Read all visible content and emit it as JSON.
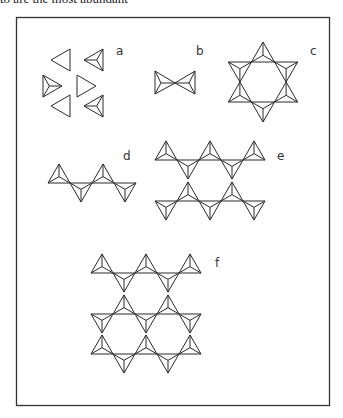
{
  "caption_fragment": "to are the most abundant",
  "figure": {
    "line_color": "#2a2a2a",
    "panels": [
      {
        "id": "a",
        "label": "a",
        "arrangement": "isolated tetrahedra (six triangles, three showing apex lines)"
      },
      {
        "id": "b",
        "label": "b",
        "arrangement": "two tetrahedra sharing one corner (bowtie)"
      },
      {
        "id": "c",
        "label": "c",
        "arrangement": "ring of six tetrahedra (six-pointed star)"
      },
      {
        "id": "d",
        "label": "d",
        "arrangement": "single chain of alternating tetrahedra"
      },
      {
        "id": "e",
        "label": "e",
        "arrangement": "double chain forming hexagonal rings"
      },
      {
        "id": "f",
        "label": "f",
        "arrangement": "sheet of tetrahedra forming hexagonal rings"
      }
    ]
  }
}
